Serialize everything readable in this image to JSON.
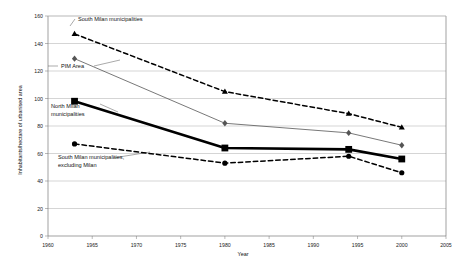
{
  "chart_data": {
    "type": "line",
    "title": "",
    "xlabel": "Year",
    "ylabel": "Inhabitants/hectare of urbanised area",
    "xlim": [
      1960,
      2005
    ],
    "ylim": [
      0,
      160
    ],
    "xticks": [
      1960,
      1965,
      1970,
      1975,
      1980,
      1985,
      1990,
      1995,
      2000,
      2005
    ],
    "yticks": [
      0,
      20,
      40,
      60,
      80,
      100,
      120,
      140,
      160
    ],
    "grid": "horizontal",
    "legend_position": "inline-annotations",
    "x": [
      1963,
      1980,
      1994,
      2000
    ],
    "series": [
      {
        "name": "South Milan municipalities",
        "label": "South Milan municipalities",
        "values": [
          147,
          105,
          89,
          79
        ],
        "style": "dashed",
        "marker": "triangle",
        "color": "#000000",
        "width": 1.5
      },
      {
        "name": "PIM Area",
        "label": "PIM Area",
        "values": [
          129,
          82,
          75,
          66
        ],
        "style": "solid",
        "marker": "diamond",
        "color": "#555555",
        "width": 0.8
      },
      {
        "name": "North Milan municipalities",
        "label": "North Milan municipalities",
        "values": [
          98,
          64,
          63,
          56
        ],
        "style": "solid",
        "marker": "square",
        "color": "#000000",
        "width": 2.6
      },
      {
        "name": "South Milan municipalities, excluding Milan",
        "label": "South Milan municipalities, excluding Milan",
        "values": [
          67,
          53,
          58,
          46
        ],
        "style": "dashed",
        "marker": "circle",
        "color": "#000000",
        "width": 1.5
      }
    ],
    "annotations": [
      {
        "text": "South Milan municipalities",
        "x": 78,
        "y": 21
      },
      {
        "text": "PIM Area",
        "x": 61,
        "y": 68
      },
      {
        "text": "North Milan",
        "x": 51,
        "y": 108
      },
      {
        "text": "municipalities",
        "x": 51,
        "y": 116
      },
      {
        "text": "South Milan municipalities,",
        "x": 58,
        "y": 159
      },
      {
        "text": "excluding Milan",
        "x": 58,
        "y": 167
      }
    ]
  }
}
